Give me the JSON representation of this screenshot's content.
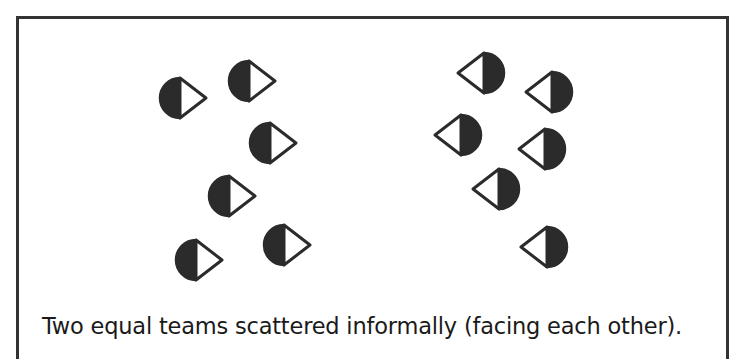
{
  "caption": "Two equal teams scattered informally (facing each other).",
  "colors": {
    "ink": "#2b2b2b",
    "frame": "#333333",
    "fill_light": "#ffffff"
  },
  "player_icon": {
    "name": "half-filled-circle-with-arrow-icon",
    "radius": 20
  },
  "teams": [
    {
      "name": "left-team",
      "facing": "right",
      "players": [
        {
          "cx": 180,
          "cy": 98
        },
        {
          "cx": 249,
          "cy": 81
        },
        {
          "cx": 270,
          "cy": 143
        },
        {
          "cx": 229,
          "cy": 196
        },
        {
          "cx": 196,
          "cy": 260
        },
        {
          "cx": 284,
          "cy": 245
        }
      ]
    },
    {
      "name": "right-team",
      "facing": "left",
      "players": [
        {
          "cx": 484,
          "cy": 73
        },
        {
          "cx": 552,
          "cy": 92
        },
        {
          "cx": 461,
          "cy": 135
        },
        {
          "cx": 545,
          "cy": 149
        },
        {
          "cx": 499,
          "cy": 189
        },
        {
          "cx": 547,
          "cy": 247
        }
      ]
    }
  ]
}
